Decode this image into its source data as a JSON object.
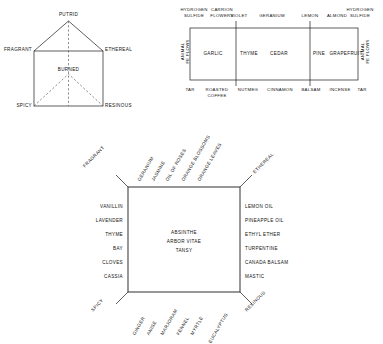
{
  "figure1": {
    "name": "odor-prism",
    "vertices": {
      "top": "PUTRID",
      "left": "FRAGRANT",
      "right": "ETHEREAL",
      "center": "BURNED",
      "bottom_left": "SPICY",
      "bottom_right": "RESINOUS"
    }
  },
  "figure2": {
    "name": "odor-band",
    "top_labels": [
      {
        "text": "HYDROGEN\nSULFIDE"
      },
      {
        "text": "CARRION\nFLOWERS"
      },
      {
        "text": "VIOLET"
      },
      {
        "text": "GERANIUM"
      },
      {
        "text": "LEMON"
      },
      {
        "text": "ALMOND"
      },
      {
        "text": "HYDROGEN\nSULFIDE"
      }
    ],
    "inner_labels": [
      "GARLIC",
      "THYME",
      "CEDAR",
      "PINE",
      "GRAPEFRUIT"
    ],
    "bottom_labels": [
      "TAR",
      "ROASTED\nCOFFEE",
      "NUTMEG",
      "CINNAMON",
      "BALSAM",
      "INCENSE",
      "TAR"
    ],
    "left_label": "ANIMAL\nFE FLOWS",
    "right_label": "ANIMAL\nFE FLOWS"
  },
  "figure3": {
    "name": "odor-square",
    "corners": {
      "top_left": "FRAGRANT",
      "top_right": "ETHEREAL",
      "bottom_left": "SPICY",
      "bottom_right": "RESINOUS"
    },
    "top_labels": [
      "GERANIUM",
      "JASMINE",
      "OIL OF ROSES",
      "ORANGE BLOSSOMS",
      "ORANGE LEAVES"
    ],
    "bottom_labels": [
      "GINGER",
      "ANISE",
      "MARJORAM",
      "FENNEL",
      "MYRTLE",
      "EUCALYPTUS"
    ],
    "left_labels": [
      "VANILLIN",
      "LAVENDER",
      "THYME",
      "BAY",
      "CLOVES",
      "CASSIA"
    ],
    "right_labels": [
      "LEMON OIL",
      "PINEAPPLE OIL",
      "ETHYL ETHER",
      "TURPENTINE",
      "CANADA BALSAM",
      "MASTIC"
    ],
    "center_labels": [
      "ABSINTHE",
      "ARBOR VITAE",
      "TANSY"
    ]
  }
}
